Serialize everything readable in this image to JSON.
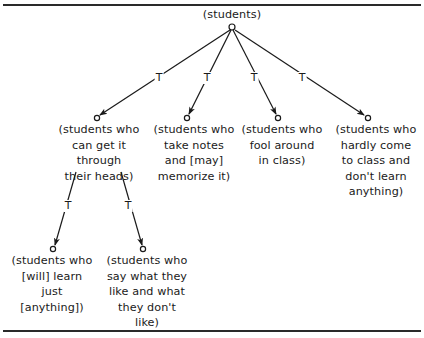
{
  "diagram": {
    "type": "tree",
    "edge_label": "T",
    "root": {
      "id": "root",
      "label": "(students)"
    },
    "level1": [
      {
        "id": "n1",
        "label": "(students who\ncan get it\nthrough\ntheir heads)"
      },
      {
        "id": "n2",
        "label": "(students who\ntake notes\nand [may]\nmemorize it)"
      },
      {
        "id": "n3",
        "label": "(students who\nfool around\nin class)"
      },
      {
        "id": "n4",
        "label": "(students who\nhardly come\nto class and\ndon't learn\nanything)"
      }
    ],
    "level2": [
      {
        "id": "n1a",
        "parent": "n1",
        "label": "(students who\n[will] learn\njust\n[anything])"
      },
      {
        "id": "n1b",
        "parent": "n1",
        "label": "(students who\nsay what they\nlike and what\nthey don't\nlike)"
      }
    ],
    "edges": [
      {
        "from": "root",
        "to": "n1",
        "label": "T"
      },
      {
        "from": "root",
        "to": "n2",
        "label": "T"
      },
      {
        "from": "root",
        "to": "n3",
        "label": "T"
      },
      {
        "from": "root",
        "to": "n4",
        "label": "T"
      },
      {
        "from": "n1",
        "to": "n1a",
        "label": "T"
      },
      {
        "from": "n1",
        "to": "n1b",
        "label": "T"
      }
    ],
    "colors": {
      "line": "#1a1a1a",
      "background": "#ffffff"
    }
  }
}
